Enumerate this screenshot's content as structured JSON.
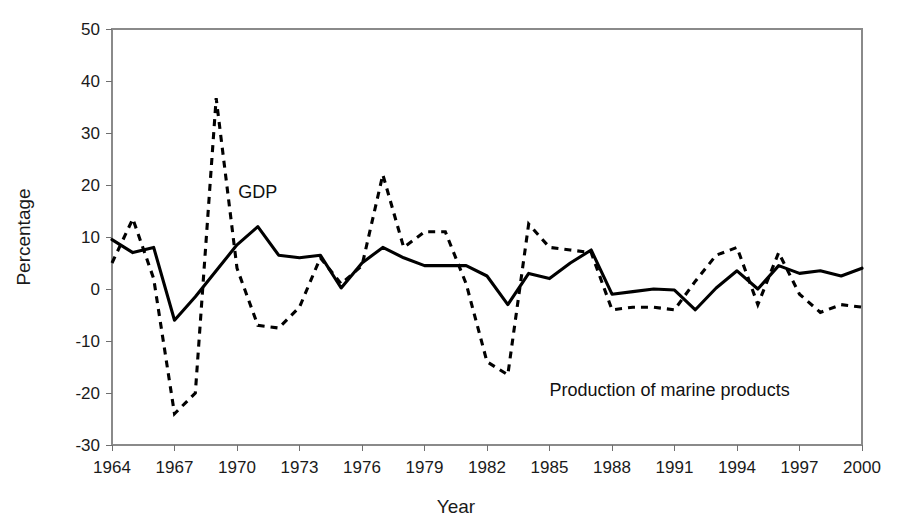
{
  "chart_data": {
    "type": "line",
    "title": "",
    "xlabel": "Year",
    "ylabel": "Percentage",
    "xlim": [
      1964,
      2000
    ],
    "ylim": [
      -30,
      50
    ],
    "ytick_step": 10,
    "xtick_step": 3,
    "grid": true,
    "legend": "inline-annotations",
    "yticks": [
      "50",
      "40",
      "30",
      "20",
      "10",
      "0",
      "-10",
      "-20",
      "-30"
    ],
    "ytick_values": [
      50,
      40,
      30,
      20,
      10,
      0,
      -10,
      -20,
      -30
    ],
    "xticks": [
      "1964",
      "1967",
      "1970",
      "1973",
      "1976",
      "1979",
      "1982",
      "1985",
      "1988",
      "1991",
      "1994",
      "1997",
      "2000"
    ],
    "xtick_values": [
      1964,
      1967,
      1970,
      1973,
      1976,
      1979,
      1982,
      1985,
      1988,
      1991,
      1994,
      1997,
      2000
    ],
    "x": [
      1964,
      1965,
      1966,
      1967,
      1968,
      1969,
      1970,
      1971,
      1972,
      1973,
      1974,
      1975,
      1976,
      1977,
      1978,
      1979,
      1980,
      1981,
      1982,
      1983,
      1984,
      1985,
      1986,
      1987,
      1988,
      1989,
      1990,
      1991,
      1992,
      1993,
      1994,
      1995,
      1996,
      1997,
      1998,
      1999,
      2000
    ],
    "series": [
      {
        "name": "GDP",
        "style": "solid",
        "color": "#000000",
        "label_text": "GDP",
        "values": [
          9.5,
          7.0,
          8.0,
          -6.0,
          -1.5,
          3.5,
          8.5,
          12.0,
          6.5,
          6.0,
          6.5,
          0.2,
          5.0,
          8.0,
          6.0,
          4.5,
          4.5,
          4.5,
          2.5,
          -3.0,
          3.0,
          2.0,
          5.0,
          7.5,
          -1.0,
          -0.5,
          0.0,
          -0.2,
          -4.0,
          0.2,
          3.5,
          0.0,
          4.5,
          3.0,
          3.5,
          2.5,
          4.0
        ]
      },
      {
        "name": "Production of marine products",
        "style": "dashed",
        "color": "#000000",
        "label_text": "Production of marine products",
        "values": [
          5.0,
          13.5,
          2.0,
          -24.0,
          -20.0,
          36.7,
          4.0,
          -7.0,
          -7.5,
          -3.5,
          6.0,
          1.0,
          4.5,
          22.0,
          8.0,
          11.0,
          11.0,
          1.0,
          -14.0,
          -16.5,
          12.5,
          8.0,
          7.5,
          7.0,
          -4.0,
          -3.5,
          -3.5,
          -4.0,
          1.5,
          6.5,
          8.0,
          -3.0,
          7.0,
          -1.0,
          -4.5,
          -3.0,
          -3.5
        ]
      }
    ],
    "annotations": [
      {
        "text": "GDP",
        "x": 1971,
        "y": 17.5
      },
      {
        "text": "Production of marine products",
        "x": 1985,
        "y": -20.5
      }
    ]
  }
}
